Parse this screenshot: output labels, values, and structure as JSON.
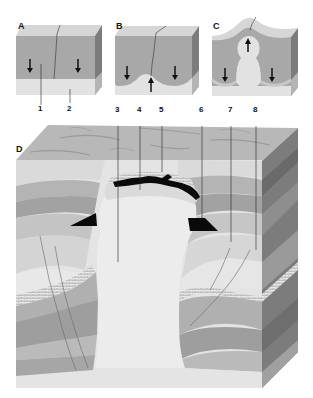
{
  "figure": {
    "panels": [
      {
        "id": "A",
        "label": "A",
        "description": "flat-lying salt layer beneath sediment, downward arrows"
      },
      {
        "id": "B",
        "label": "B",
        "description": "salt begins to rise into a pillow, one upward arrow between two downward arrows"
      },
      {
        "id": "C",
        "label": "C",
        "description": "salt diapir rises as a bulb, doming the surface"
      },
      {
        "id": "D",
        "label": "D",
        "description": "mature salt dome piercing folded strata with cap rock and traps"
      }
    ],
    "callouts": [
      {
        "id": "1",
        "label": "1"
      },
      {
        "id": "2",
        "label": "2"
      },
      {
        "id": "3",
        "label": "3"
      },
      {
        "id": "4",
        "label": "4"
      },
      {
        "id": "5",
        "label": "5"
      },
      {
        "id": "6",
        "label": "6"
      },
      {
        "id": "7",
        "label": "7"
      },
      {
        "id": "8",
        "label": "8"
      }
    ],
    "arrows": {
      "A": [
        "down",
        "down"
      ],
      "B": [
        "down",
        "up",
        "down"
      ],
      "C": [
        "down",
        "up",
        "down"
      ]
    },
    "colors": {
      "sediment_top": "#d4d4d4",
      "sediment": "#a9a9a9",
      "salt": "#e3e3e3",
      "block_side": "#7a7a7a",
      "surface": "#b8b8b8",
      "trap_black": "#0a0a0a",
      "line": "#222222"
    }
  }
}
